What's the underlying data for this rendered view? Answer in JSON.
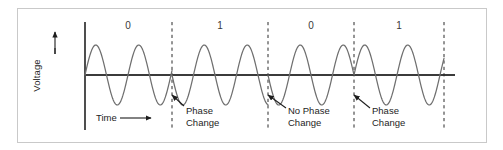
{
  "figure": {
    "kind": "psk-waveform-diagram",
    "background_color": "#ffffff",
    "frame_border_color": "#c9c9c9",
    "wave_color": "#6e6e6e",
    "axis_color": "#3b3b3b",
    "dash_color": "#2b2b2b",
    "text_color": "#1d1d1d"
  },
  "axes": {
    "y_axis_label": "Voltage",
    "y_axis_arrow_icon": "up-arrow-icon",
    "x_axis_label": "Time",
    "x_axis_arrow_icon": "right-arrow-icon"
  },
  "bits": [
    {
      "label": "0",
      "center_x": 128
    },
    {
      "label": "1",
      "center_x": 220
    },
    {
      "label": "0",
      "center_x": 311
    },
    {
      "label": "1",
      "center_x": 399
    }
  ],
  "boundaries": [
    {
      "x": 172,
      "transition": "Phase Change"
    },
    {
      "x": 268,
      "transition": "No Phase Change"
    },
    {
      "x": 354,
      "transition": "Phase Change"
    },
    {
      "x": 444,
      "transition": ""
    }
  ],
  "annotations": [
    {
      "line1": "Phase",
      "line2": "Change",
      "text_x": 186,
      "text_y": 105,
      "arrow_from_x": 184,
      "arrow_from_y": 106,
      "arrow_to_x": 172,
      "arrow_to_y": 95
    },
    {
      "line1": "No Phase",
      "line2": "Change",
      "text_x": 288,
      "text_y": 105,
      "arrow_from_x": 286,
      "arrow_from_y": 108,
      "arrow_to_x": 268,
      "arrow_to_y": 95
    },
    {
      "line1": "Phase",
      "line2": "Change",
      "text_x": 372,
      "text_y": 105,
      "arrow_from_x": 370,
      "arrow_from_y": 108,
      "arrow_to_x": 354,
      "arrow_to_y": 95
    }
  ],
  "chart_data": {
    "type": "line",
    "title": "",
    "xlabel": "Time",
    "ylabel": "Voltage",
    "grid": false,
    "legend": "none",
    "bit_sequence": [
      "0",
      "1",
      "0",
      "1"
    ],
    "phase_transitions": [
      "Phase Change",
      "No Phase Change",
      "Phase Change"
    ],
    "axis_origin": {
      "x": 85,
      "y": 75
    },
    "axis_y_top": 22,
    "axis_y_bottom": 130,
    "axis_x_end": 455,
    "carrier": {
      "amplitude_px": 30,
      "period_px": 43,
      "cycles_per_bit": 2
    },
    "bit_boundaries_x": [
      85,
      172,
      268,
      354,
      444
    ],
    "segments": [
      {
        "bit": "0",
        "x_start": 85,
        "x_end": 172,
        "phase_deg": 0
      },
      {
        "bit": "1",
        "x_start": 172,
        "x_end": 268,
        "phase_deg": 180
      },
      {
        "bit": "0",
        "x_start": 268,
        "x_end": 354,
        "phase_deg": 180
      },
      {
        "bit": "1",
        "x_start": 354,
        "x_end": 444,
        "phase_deg": 0
      }
    ],
    "ylim": [
      -40,
      40
    ],
    "xlim": [
      85,
      455
    ]
  }
}
